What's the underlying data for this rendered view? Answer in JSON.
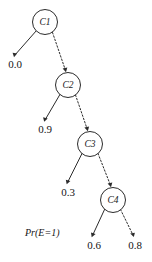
{
  "figure": {
    "name": "probability-tree-diagram",
    "caption": "Pr(E=1)",
    "background_color": "#ffffff",
    "stroke_color": "#2b2b2b"
  },
  "nodes": [
    {
      "id": "C1",
      "label": "C1",
      "cx": 45,
      "cy": 22,
      "r": 12.5
    },
    {
      "id": "C2",
      "label": "C2",
      "cx": 68,
      "cy": 85,
      "r": 12.5
    },
    {
      "id": "C3",
      "label": "C3",
      "cx": 90,
      "cy": 144,
      "r": 12.5
    },
    {
      "id": "C4",
      "label": "C4",
      "cx": 113,
      "cy": 200,
      "r": 12.5
    }
  ],
  "leaves": [
    {
      "id": "leaf-0-0",
      "value": "0.0",
      "x": 15,
      "y": 65,
      "from": "C1",
      "style": "solid"
    },
    {
      "id": "leaf-0-9",
      "value": "0.9",
      "x": 45,
      "y": 130,
      "from": "C2",
      "style": "solid"
    },
    {
      "id": "leaf-0-3",
      "value": "0.3",
      "x": 68,
      "y": 193,
      "from": "C3",
      "style": "solid"
    },
    {
      "id": "leaf-0-6",
      "value": "0.6",
      "x": 94,
      "y": 246,
      "from": "C4",
      "style": "solid"
    },
    {
      "id": "leaf-0-8",
      "value": "0.8",
      "x": 135,
      "y": 246,
      "from": "C4",
      "style": "dashed"
    }
  ],
  "edges": [
    {
      "from": "C1",
      "to": "leaf-0-0",
      "style": "solid"
    },
    {
      "from": "C1",
      "to": "C2",
      "style": "dashed"
    },
    {
      "from": "C2",
      "to": "leaf-0-9",
      "style": "solid"
    },
    {
      "from": "C2",
      "to": "C3",
      "style": "dashed"
    },
    {
      "from": "C3",
      "to": "leaf-0-3",
      "style": "solid"
    },
    {
      "from": "C3",
      "to": "C4",
      "style": "dashed"
    },
    {
      "from": "C4",
      "to": "leaf-0-6",
      "style": "solid"
    },
    {
      "from": "C4",
      "to": "leaf-0-8",
      "style": "dashed"
    }
  ]
}
